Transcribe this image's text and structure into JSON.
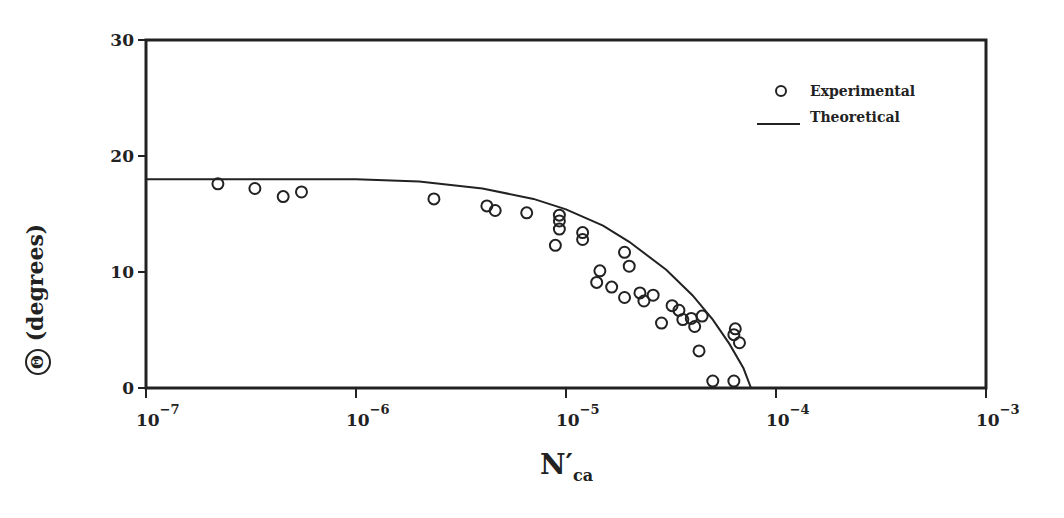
{
  "chart_data": {
    "type": "scatter",
    "title": "",
    "xlabel": "N'ca",
    "xlabel_main": "N′",
    "xlabel_sub": "ca",
    "ylabel": "Θ (degrees)",
    "ylabel_symbol": "Θ",
    "ylabel_unit": "(degrees)",
    "xscale": "log",
    "xlim": [
      1e-07,
      0.001
    ],
    "ylim": [
      0,
      30
    ],
    "x_ticks": [
      {
        "base": "10",
        "exp": "−7",
        "value": 1e-07
      },
      {
        "base": "10",
        "exp": "−6",
        "value": 1e-06
      },
      {
        "base": "10",
        "exp": "−5",
        "value": 1e-05
      },
      {
        "base": "10",
        "exp": "−4",
        "value": 0.0001
      },
      {
        "base": "10",
        "exp": "−3",
        "value": 0.001
      }
    ],
    "y_ticks": [
      "0",
      "10",
      "20",
      "30"
    ],
    "grid": false,
    "legend": {
      "position": "upper right",
      "entries": [
        {
          "label": "Experimental",
          "marker": "open-circle"
        },
        {
          "label": "Theoretical",
          "marker": "line"
        }
      ]
    },
    "series": [
      {
        "name": "Experimental",
        "kind": "scatter",
        "points": [
          [
            2.2e-07,
            17.6
          ],
          [
            3.3e-07,
            17.2
          ],
          [
            4.5e-07,
            16.5
          ],
          [
            5.5e-07,
            16.9
          ],
          [
            2.35e-06,
            16.3
          ],
          [
            4.2e-06,
            15.7
          ],
          [
            4.6e-06,
            15.3
          ],
          [
            6.5e-06,
            15.1
          ],
          [
            9.3e-06,
            14.9
          ],
          [
            9.3e-06,
            14.4
          ],
          [
            9.3e-06,
            13.7
          ],
          [
            8.9e-06,
            12.3
          ],
          [
            1.2e-05,
            13.4
          ],
          [
            1.2e-05,
            12.8
          ],
          [
            1.9e-05,
            11.7
          ],
          [
            2e-05,
            10.5
          ],
          [
            1.45e-05,
            10.1
          ],
          [
            1.4e-05,
            9.1
          ],
          [
            1.65e-05,
            8.7
          ],
          [
            1.9e-05,
            7.8
          ],
          [
            2.25e-05,
            8.2
          ],
          [
            2.35e-05,
            7.5
          ],
          [
            2.6e-05,
            8.0
          ],
          [
            2.85e-05,
            5.6
          ],
          [
            3.2e-05,
            7.1
          ],
          [
            3.45e-05,
            6.7
          ],
          [
            3.6e-05,
            5.9
          ],
          [
            3.95e-05,
            6.0
          ],
          [
            4.1e-05,
            5.3
          ],
          [
            4.45e-05,
            6.2
          ],
          [
            4.3e-05,
            3.2
          ],
          [
            6.4e-05,
            5.1
          ],
          [
            6.3e-05,
            4.6
          ],
          [
            6.7e-05,
            3.9
          ],
          [
            5e-05,
            0.6
          ],
          [
            6.3e-05,
            0.6
          ]
        ]
      },
      {
        "name": "Theoretical",
        "kind": "line",
        "points": [
          [
            1e-07,
            18.0
          ],
          [
            1e-06,
            18.0
          ],
          [
            2e-06,
            17.8
          ],
          [
            4e-06,
            17.2
          ],
          [
            7e-06,
            16.3
          ],
          [
            1e-05,
            15.4
          ],
          [
            1.5e-05,
            14.0
          ],
          [
            2e-05,
            12.6
          ],
          [
            3e-05,
            10.2
          ],
          [
            4e-05,
            8.0
          ],
          [
            5e-05,
            5.9
          ],
          [
            6e-05,
            3.8
          ],
          [
            7e-05,
            1.7
          ],
          [
            7.6e-05,
            0.0
          ]
        ]
      }
    ]
  }
}
